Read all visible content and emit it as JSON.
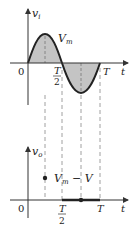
{
  "top_graph": {
    "y_label": "v",
    "y_label_sub": "i",
    "x_label": "t",
    "origin_label": "0",
    "peak_label": "V",
    "peak_label_sub": "m",
    "half_period_num": "T",
    "half_period_den": "2",
    "period_label": "T"
  },
  "bottom_graph": {
    "y_label": "v",
    "y_label_sub": "o",
    "x_label": "t",
    "origin_label": "0",
    "level_label": "V",
    "level_label_sub": "m",
    "level_label_rest": " − V",
    "half_period_num": "T",
    "half_period_den": "2",
    "period_label": "T"
  },
  "colors": {
    "curve": "#222222",
    "fill": "#bdbdbd",
    "axis": "#333333",
    "dashed": "#888888"
  }
}
